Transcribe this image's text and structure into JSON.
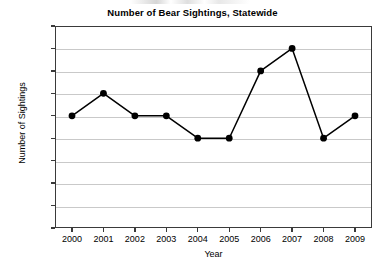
{
  "chart_data": {
    "type": "line",
    "title": "Number of Bear Sightings, Statewide",
    "xlabel": "Year",
    "ylabel": "Number of Sightings",
    "categories": [
      "2000",
      "2001",
      "2002",
      "2003",
      "2004",
      "2005",
      "2006",
      "2007",
      "2008",
      "2009"
    ],
    "values": [
      250,
      300,
      250,
      250,
      200,
      200,
      350,
      400,
      200,
      250
    ],
    "series": [
      {
        "name": "Bear Sightings",
        "values": [
          250,
          300,
          250,
          250,
          200,
          200,
          350,
          400,
          200,
          250
        ]
      }
    ],
    "ylim": [
      0,
      450
    ],
    "yticks": [
      0,
      50,
      100,
      150,
      200,
      250,
      300,
      350,
      400,
      450
    ],
    "ytick_labels": [
      "0",
      "50",
      "100",
      "150",
      "200",
      "250",
      "300",
      "350",
      "400",
      "450"
    ],
    "xtick_labels": [
      "2000",
      "2001",
      "2002",
      "2003",
      "2004",
      "2005",
      "2006",
      "2007",
      "2008",
      "2009"
    ],
    "grid": "horizontal",
    "legend": "none",
    "colors": {
      "line": "#000000",
      "marker": "#000000",
      "gridline": "#c9c9c9",
      "axis": "#3a3a3a",
      "background": "#ffffff",
      "text": "#000000"
    },
    "marker": "circle",
    "annotations": []
  }
}
